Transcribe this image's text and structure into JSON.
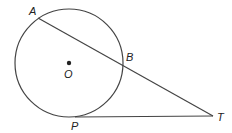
{
  "diagram": {
    "type": "geometry",
    "colors": {
      "stroke": "#444444",
      "label": "#222222",
      "background": "#ffffff"
    },
    "circle": {
      "center_label": "O",
      "cx": 69,
      "cy": 63,
      "r": 54
    },
    "points": [
      {
        "id": "A",
        "label": "A",
        "x": 38,
        "y": 18
      },
      {
        "id": "B",
        "label": "B",
        "x": 122,
        "y": 63
      },
      {
        "id": "O",
        "label": "O",
        "x": 69,
        "y": 63
      },
      {
        "id": "P",
        "label": "P",
        "x": 75,
        "y": 117
      },
      {
        "id": "T",
        "label": "T",
        "x": 213,
        "y": 116
      }
    ],
    "segments": [
      {
        "name": "secant-AT",
        "from": "A",
        "to": "T"
      },
      {
        "name": "tangent-PT",
        "from": "P",
        "to": "T"
      }
    ],
    "labels": {
      "A": "A",
      "B": "B",
      "O": "O",
      "P": "P",
      "T": "T"
    }
  }
}
